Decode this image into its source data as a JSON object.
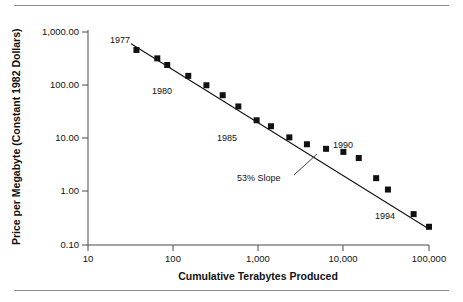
{
  "chart_data": {
    "type": "scatter",
    "title": "",
    "xlabel": "Cumulative Terabytes Produced",
    "ylabel": "Price per Megabyte (Constant 1982 Dollars)",
    "xscale": "log",
    "yscale": "log",
    "xlim": [
      10,
      100000
    ],
    "ylim": [
      0.1,
      1000
    ],
    "grid": false,
    "legend": null,
    "xticks": [
      10,
      100,
      1000,
      10000,
      100000
    ],
    "xtick_labels": [
      "10",
      "100",
      "1,000",
      "10,000",
      "100,000"
    ],
    "yticks": [
      0.1,
      1,
      10,
      100,
      1000
    ],
    "ytick_labels": [
      "0.10",
      "1.00",
      "10.00",
      "100.00",
      "1,000.00"
    ],
    "series": [
      {
        "name": "Price per Megabyte",
        "marker": "square",
        "color": "#111111",
        "x": [
          37,
          65,
          85,
          150,
          245,
          380,
          580,
          950,
          1400,
          2300,
          3700,
          6200,
          9900,
          15000,
          24000,
          33000,
          66000,
          100000
        ],
        "y": [
          460,
          320,
          240,
          150,
          100,
          65,
          40,
          22,
          17,
          10.5,
          7.8,
          6.4,
          5.6,
          4.3,
          1.8,
          1.1,
          0.38,
          0.22
        ]
      }
    ],
    "trendline": {
      "name": "53% Slope",
      "x": [
        32,
        100000
      ],
      "y": [
        600,
        0.2
      ]
    },
    "annotations": [
      {
        "text": "1977",
        "x": 37,
        "y": 760
      },
      {
        "text": "1980",
        "x": 185,
        "y": 66
      },
      {
        "text": "1985",
        "x": 1000,
        "y": 6.6
      },
      {
        "text": "1990",
        "x": 17000,
        "y": 6.2
      },
      {
        "text": "1994",
        "x": 58000,
        "y": 0.13
      },
      {
        "text": "53% Slope",
        "x": 1600,
        "y": 1.6
      }
    ]
  },
  "figure": {
    "axis_color": "#4a4a4a",
    "marker_color": "#111111",
    "rule_color": "#8a8a8a",
    "background": "#ffffff"
  }
}
